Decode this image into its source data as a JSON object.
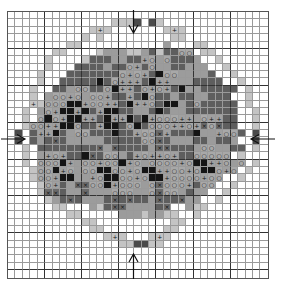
{
  "chart_data": {
    "type": "table",
    "title": "",
    "cols": 35,
    "rows_count": 36,
    "bold_every": 5,
    "legend": {
      ".": "empty",
      "L": "light gray",
      "l": "light gray with plus symbol",
      "M": "medium gray",
      "o": "medium gray with circle symbol",
      "p": "medium gray with plus symbol",
      "D": "dark gray",
      "x": "dark gray with cross symbol",
      "K": "black",
      "A": "edge center marker (dark)"
    },
    "symbols": {
      "o": "○",
      "p": "+",
      "l": "+",
      "x": "×"
    },
    "colors": {
      "empty": "#ffffff",
      "light": "#c4c4c4",
      "medium": "#9c9c9c",
      "dark": "#5e5e5e",
      "black": "#151515",
      "gridline": "#9a9a9a",
      "boldline": "#333333"
    },
    "arrows": {
      "top": {
        "col": 17,
        "direction": "down"
      },
      "bottom": {
        "col": 17,
        "direction": "up"
      },
      "left": {
        "row": 17,
        "direction": "right"
      },
      "right": {
        "row": 17,
        "direction": "left"
      }
    },
    "rows": [
      "...................................",
      "..............LLLA.AL..............",
      "...........LlL.......LlL...........",
      "..........L.L.........LL...........",
      "........LL...........M...LL........",
      "......LL....LMMMLLMDLDDoo.LL.......",
      ".....L....LDDDMMDDpoMoDDDM..L......",
      ".....L...DDDDMDDopDoMMDDMMM..L.....",
      "....L...DDDDDDDopopDKooMMMMD..L....",
      "....L..DDDDDKDopppDKppMMMDDDD..L...",
      "...L..DDMooDDoKppDopopDKMMDDDDD.L..",
      "...L.MoopoMoopDDpDKoDDMDDMMDDD..L..",
      "...lLoooKKpooppDKppoDKKMDoDDDDD.L..",
      "..L.MopKKpKDpKKDDMMDKDMMDDDDDDD..L.",
      "..L.oKopKKppDKppKDKpoooppMoppDD..L.",
      "..LooppKKoDDpKKDoKDoooppopxoxDD..L.",
      ".A.DppKDMooDDDKDDpooxpDDDKMMpooD.A.",
      ".A.DMDxDMMMMMDDDDDooxDMMMDDMDDM..A.",
      "..L.DDDDDDDDxMxDDDDMxxDDDMooMMDD.L.",
      "..L.MpopDDKxDooMDpoppopDDooooo.L...",
      "..L.oooKpMoopooKpoMoooopoKKppoMo.L..",
      "...LooKpoMooKKoopoKKppoopoKKopo.L..",
      "...LoopKKMMpoKKoopoKKpoooopoo..L...",
      "....LopDMxxooKpoooMoxooopDoo..L....",
      "....LxxDMMxMMMoooMMoxooMDMM..L.....",
      ".....LMDxDMMMDxDxDDMxDDxMM..L......",
      "......LL...MLDxxMMMMDx..MLL........",
      "........LL.....MMMLMMLL..L.........",
      "..........LL..........LL...........",
      "...........LL........LL............",
      ".............LlL...LlL.............",
      "...............LLAALL..............",
      "...................................",
      "...................................",
      "...................................",
      "..................................."
    ]
  }
}
